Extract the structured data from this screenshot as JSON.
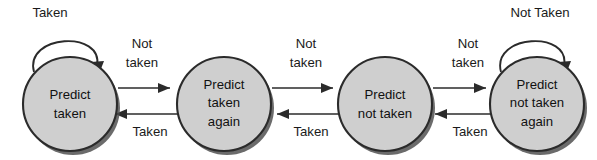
{
  "diagram": {
    "type": "state-machine",
    "background_color": "#ffffff",
    "state_fill_color": "#cfcfcf",
    "state_stroke_color": "#2b2b2b",
    "text_color": "#111111",
    "states": [
      {
        "id": "predict-taken",
        "lines": [
          "Predict",
          "taken"
        ],
        "line1": "Predict",
        "line2": "taken",
        "line3": "",
        "cx": 70,
        "cy": 104,
        "r": 47
      },
      {
        "id": "predict-taken-again",
        "lines": [
          "Predict",
          "taken",
          "again"
        ],
        "line1": "Predict",
        "line2": "taken",
        "line3": "again",
        "cx": 224,
        "cy": 104,
        "r": 47
      },
      {
        "id": "predict-not-taken",
        "lines": [
          "Predict",
          "not taken"
        ],
        "line1": "Predict",
        "line2": "not taken",
        "line3": "",
        "cx": 385,
        "cy": 104,
        "r": 47
      },
      {
        "id": "predict-not-taken-again",
        "lines": [
          "Predict",
          "not taken",
          "again"
        ],
        "line1": "Predict",
        "line2": "not taken",
        "line3": "again",
        "cx": 537,
        "cy": 104,
        "r": 47
      }
    ],
    "self_loops": [
      {
        "id": "loop-predict-taken",
        "state": "predict-taken",
        "label": "Taken",
        "label_x": 50,
        "label_y": 14
      },
      {
        "id": "loop-predict-not-taken-again",
        "state": "predict-not-taken-again",
        "label": "Not Taken",
        "label_x": 540,
        "label_y": 14
      }
    ],
    "transitions_forward": [
      {
        "id": "taken-to-taken-again",
        "from": "predict-taken",
        "to": "predict-taken-again",
        "label_line1": "Not",
        "label_line2": "taken",
        "label_x": 142,
        "label_y_line1": 45,
        "label_y_line2": 64
      },
      {
        "id": "taken-again-to-not-taken",
        "from": "predict-taken-again",
        "to": "predict-not-taken",
        "label_line1": "Not",
        "label_line2": "taken",
        "label_x": 306,
        "label_y_line1": 45,
        "label_y_line2": 64
      },
      {
        "id": "not-taken-to-not-taken-again",
        "from": "predict-not-taken",
        "to": "predict-not-taken-again",
        "label_line1": "Not",
        "label_line2": "taken",
        "label_x": 468,
        "label_y_line1": 45,
        "label_y_line2": 64
      }
    ],
    "transitions_backward": [
      {
        "id": "taken-again-to-taken",
        "from": "predict-taken-again",
        "to": "predict-taken",
        "label": "Taken",
        "label_x": 150,
        "label_y": 133
      },
      {
        "id": "not-taken-to-taken-again",
        "from": "predict-not-taken",
        "to": "predict-taken-again",
        "label": "Taken",
        "label_x": 311,
        "label_y": 133
      },
      {
        "id": "not-taken-again-to-not-taken",
        "from": "predict-not-taken-again",
        "to": "predict-not-taken",
        "label": "Taken",
        "label_x": 470,
        "label_y": 133
      }
    ]
  }
}
